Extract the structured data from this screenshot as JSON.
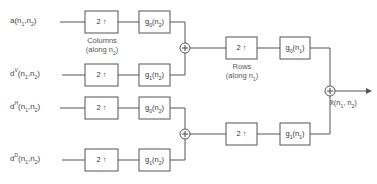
{
  "diagram": {
    "inputs": [
      {
        "id": "a",
        "base": "a",
        "sup": "",
        "args": "(n",
        "s1": "1",
        "mid": ",n",
        "s2": "2",
        "end": ")"
      },
      {
        "id": "dV",
        "base": "d",
        "sup": "V",
        "args": "(n",
        "s1": "1",
        "mid": ",n",
        "s2": "2",
        "end": ")"
      },
      {
        "id": "dH",
        "base": "d",
        "sup": "H",
        "args": "(n",
        "s1": "1",
        "mid": ",n",
        "s2": "2",
        "end": ")"
      },
      {
        "id": "dD",
        "base": "d",
        "sup": "D",
        "args": "(n",
        "s1": "1",
        "mid": ",n",
        "s2": "2",
        "end": ")"
      }
    ],
    "stage1": {
      "upsamplers": [
        {
          "label": "2",
          "arrow": "↑"
        },
        {
          "label": "2",
          "arrow": "↑"
        },
        {
          "label": "2",
          "arrow": "↑"
        },
        {
          "label": "2",
          "arrow": "↑"
        }
      ],
      "filters": [
        {
          "g": "g",
          "sub": "0",
          "arg": "(n",
          "argsub": "2",
          "end": ")"
        },
        {
          "g": "g",
          "sub": "1",
          "arg": "(n",
          "argsub": "2",
          "end": ")"
        },
        {
          "g": "g",
          "sub": "0",
          "arg": "(n",
          "argsub": "2",
          "end": ")"
        },
        {
          "g": "g",
          "sub": "1",
          "arg": "(n",
          "argsub": "2",
          "end": ")"
        }
      ],
      "caption_line1": "Columns",
      "caption_line2a": "(along n",
      "caption_line2sub": "2",
      "caption_line2b": ")"
    },
    "stage2": {
      "upsamplers": [
        {
          "label": "2",
          "arrow": "↑"
        },
        {
          "label": "2",
          "arrow": "↑"
        }
      ],
      "filters": [
        {
          "g": "g",
          "sub": "0",
          "arg": "(n",
          "argsub": "1",
          "end": ")"
        },
        {
          "g": "g",
          "sub": "1",
          "arg": "(n",
          "argsub": "1",
          "end": ")"
        }
      ],
      "caption_line1": "Rows",
      "caption_line2a": "(along n",
      "caption_line2sub": "1",
      "caption_line2b": ")"
    },
    "summer_symbol": "+",
    "output": {
      "base": "x̂",
      "args": "(n",
      "s1": "1",
      "mid": ", n",
      "s2": "2",
      "end": ")"
    },
    "colors": {
      "line": "#555555",
      "box_border": "#555555",
      "text": "#333333",
      "background": "#ffffff"
    }
  }
}
